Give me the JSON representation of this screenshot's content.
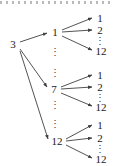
{
  "figure": {
    "type": "tree-diagram",
    "line_color": "#3f3f3f",
    "text_color": "#1a1a1a",
    "background": "#ffffff",
    "ellipsis_glyph": "⋮",
    "top_rule_glyph": "dotted-rule"
  },
  "nodes": {
    "root": {
      "label": "3",
      "x": 13,
      "y": 44
    },
    "level1": [
      {
        "label": "1",
        "x": 55,
        "y": 32
      },
      {
        "label": "7",
        "x": 54,
        "y": 89
      },
      {
        "label": "12",
        "x": 57,
        "y": 141
      }
    ],
    "level2_groups": [
      {
        "parent": "1",
        "leaves": [
          {
            "label": "1",
            "x": 100,
            "y": 18
          },
          {
            "label": "2",
            "x": 100,
            "y": 30
          },
          {
            "label": "12",
            "x": 101,
            "y": 51
          }
        ],
        "ellipsis": {
          "x": 100,
          "y": 41
        }
      },
      {
        "parent": "7",
        "leaves": [
          {
            "label": "1",
            "x": 100,
            "y": 75
          },
          {
            "label": "2",
            "x": 100,
            "y": 87
          },
          {
            "label": "12",
            "x": 101,
            "y": 107
          }
        ],
        "ellipsis": {
          "x": 100,
          "y": 98
        }
      },
      {
        "parent": "12",
        "leaves": [
          {
            "label": "1",
            "x": 100,
            "y": 125
          },
          {
            "label": "2",
            "x": 100,
            "y": 138
          },
          {
            "label": "12",
            "x": 101,
            "y": 159
          }
        ],
        "ellipsis": {
          "x": 100,
          "y": 149
        }
      }
    ]
  },
  "column_ellipses": [
    {
      "name": "between-1-and-7-upper",
      "x": 55,
      "y": 52
    },
    {
      "name": "between-1-and-7-lower",
      "x": 55,
      "y": 73
    },
    {
      "name": "between-7-and-12-upper",
      "x": 55,
      "y": 105
    },
    {
      "name": "between-7-and-12-lower",
      "x": 55,
      "y": 124
    }
  ],
  "edges": {
    "from_root": [
      {
        "to": "1",
        "x1": 20,
        "y1": 42,
        "x2": 47,
        "y2": 33
      },
      {
        "to": "7",
        "x1": 20,
        "y1": 49,
        "x2": 47,
        "y2": 87
      },
      {
        "to": "12",
        "x1": 20,
        "y1": 51,
        "x2": 48,
        "y2": 139
      }
    ],
    "group_1": [
      {
        "to": "1",
        "x1": 62,
        "y1": 30,
        "x2": 92,
        "y2": 18
      },
      {
        "to": "2",
        "x1": 62,
        "y1": 32,
        "x2": 92,
        "y2": 30
      },
      {
        "to": "12",
        "x1": 62,
        "y1": 36,
        "x2": 92,
        "y2": 50
      }
    ],
    "group_7": [
      {
        "to": "1",
        "x1": 61,
        "y1": 87,
        "x2": 92,
        "y2": 75
      },
      {
        "to": "2",
        "x1": 61,
        "y1": 89,
        "x2": 92,
        "y2": 87
      },
      {
        "to": "12",
        "x1": 61,
        "y1": 93,
        "x2": 92,
        "y2": 106
      }
    ],
    "group_12": [
      {
        "to": "1",
        "x1": 66,
        "y1": 139,
        "x2": 92,
        "y2": 125
      },
      {
        "to": "2",
        "x1": 66,
        "y1": 141,
        "x2": 92,
        "y2": 138
      },
      {
        "to": "12",
        "x1": 66,
        "y1": 145,
        "x2": 92,
        "y2": 158
      }
    ]
  }
}
